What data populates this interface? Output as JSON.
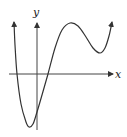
{
  "chart_data": {
    "type": "line",
    "title": "",
    "xlabel": "x",
    "ylabel": "y",
    "grid": false,
    "legend": null,
    "series": [
      {
        "name": "f(x)",
        "points_px": [
          [
            14,
            22
          ],
          [
            15,
            45
          ],
          [
            17,
            74
          ],
          [
            21,
            104
          ],
          [
            26,
            122
          ],
          [
            29,
            127
          ],
          [
            33,
            124
          ],
          [
            37,
            112
          ],
          [
            42,
            95
          ],
          [
            48,
            74
          ],
          [
            55,
            48
          ],
          [
            62,
            30
          ],
          [
            70,
            23
          ],
          [
            78,
            26
          ],
          [
            86,
            37
          ],
          [
            93,
            48
          ],
          [
            100,
            53
          ],
          [
            105,
            48
          ],
          [
            109,
            36
          ],
          [
            112,
            22
          ]
        ]
      }
    ],
    "axes": {
      "x_axis_y_px": 74,
      "y_axis_x_px": 37,
      "x_range_px": [
        9,
        113
      ],
      "y_range_px": [
        22,
        130
      ]
    },
    "colors": {
      "curve": "#333333",
      "axes": "#333333",
      "background": "#ffffff"
    }
  },
  "labels": {
    "x": "x",
    "y": "y"
  }
}
